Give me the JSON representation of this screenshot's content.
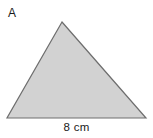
{
  "figure": {
    "shape_label": "A",
    "shape_type": "triangle",
    "base_dimension_label": "8 cm",
    "colors": {
      "background": "#ffffff",
      "fill": "#d2d2d2",
      "stroke": "#6e6e6e",
      "text": "#1a1a1a"
    },
    "geometry": {
      "apex": [
        62,
        22
      ],
      "bottom_left": [
        7,
        118
      ],
      "bottom_right": [
        146,
        118
      ]
    }
  }
}
